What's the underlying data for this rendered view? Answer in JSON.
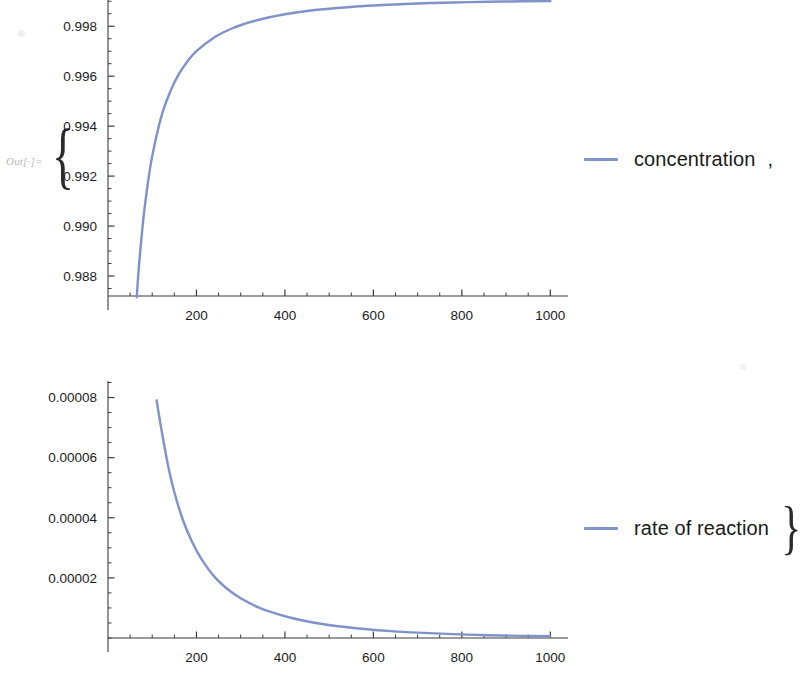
{
  "notebook": {
    "out_prompt": "Out[·]=",
    "brace_open": "{",
    "brace_close": "}",
    "legend_separator": ","
  },
  "legend": {
    "concentration": {
      "label": "concentration",
      "color": "#7f92c9"
    },
    "rate": {
      "label": "rate of reaction",
      "color": "#7f92c9"
    }
  },
  "chart_data": [
    {
      "type": "line",
      "title": "",
      "xlabel": "",
      "ylabel": "",
      "series_name": "concentration",
      "color": "#7f92c9",
      "grid": false,
      "legend_position": "right",
      "xlim": [
        0,
        1040
      ],
      "ylim": [
        0.9872,
        0.99905
      ],
      "xticks": [
        200,
        400,
        600,
        800,
        1000
      ],
      "xtick_labels": [
        "200",
        "400",
        "600",
        "800",
        "1000"
      ],
      "x_minor_step": 50,
      "yticks": [
        0.988,
        0.99,
        0.992,
        0.994,
        0.996,
        0.998
      ],
      "ytick_labels": [
        "0.988",
        "0.990",
        "0.992",
        "0.994",
        "0.996",
        "0.998"
      ],
      "y_minor_step": 0.0005,
      "x": [
        65,
        70,
        80,
        90,
        100,
        120,
        140,
        160,
        180,
        200,
        240,
        280,
        320,
        360,
        400,
        450,
        500,
        560,
        620,
        700,
        780,
        860,
        940,
        1000
      ],
      "y": [
        0.98715,
        0.9884,
        0.9903,
        0.9917,
        0.9928,
        0.99435,
        0.99535,
        0.99608,
        0.9966,
        0.997,
        0.99755,
        0.99791,
        0.99816,
        0.99834,
        0.99848,
        0.99861,
        0.9987,
        0.99879,
        0.99885,
        0.99891,
        0.99895,
        0.99898,
        0.999,
        0.99901
      ]
    },
    {
      "type": "line",
      "title": "",
      "xlabel": "",
      "ylabel": "",
      "series_name": "rate of reaction",
      "color": "#7f92c9",
      "grid": false,
      "legend_position": "right",
      "xlim": [
        0,
        1040
      ],
      "ylim": [
        0,
        8.55e-05
      ],
      "xticks": [
        200,
        400,
        600,
        800,
        1000
      ],
      "xtick_labels": [
        "200",
        "400",
        "600",
        "800",
        "1000"
      ],
      "x_minor_step": 50,
      "yticks": [
        2e-05,
        4e-05,
        6e-05,
        8e-05
      ],
      "ytick_labels": [
        "0.00002",
        "0.00004",
        "0.00006",
        "0.00008"
      ],
      "y_minor_step": 5e-06,
      "x": [
        110,
        120,
        135,
        150,
        170,
        190,
        210,
        240,
        270,
        300,
        340,
        380,
        420,
        470,
        520,
        580,
        640,
        700,
        780,
        860,
        940,
        1000
      ],
      "y": [
        7.9e-05,
        7e-05,
        5.8e-05,
        4.85e-05,
        3.9e-05,
        3.2e-05,
        2.66e-05,
        2.05e-05,
        1.63e-05,
        1.32e-05,
        1.02e-05,
        8.1e-06,
        6.5e-06,
        5e-06,
        3.9e-06,
        3e-06,
        2.3e-06,
        1.8e-06,
        1.3e-06,
        9e-07,
        7e-07,
        6e-07
      ]
    }
  ]
}
